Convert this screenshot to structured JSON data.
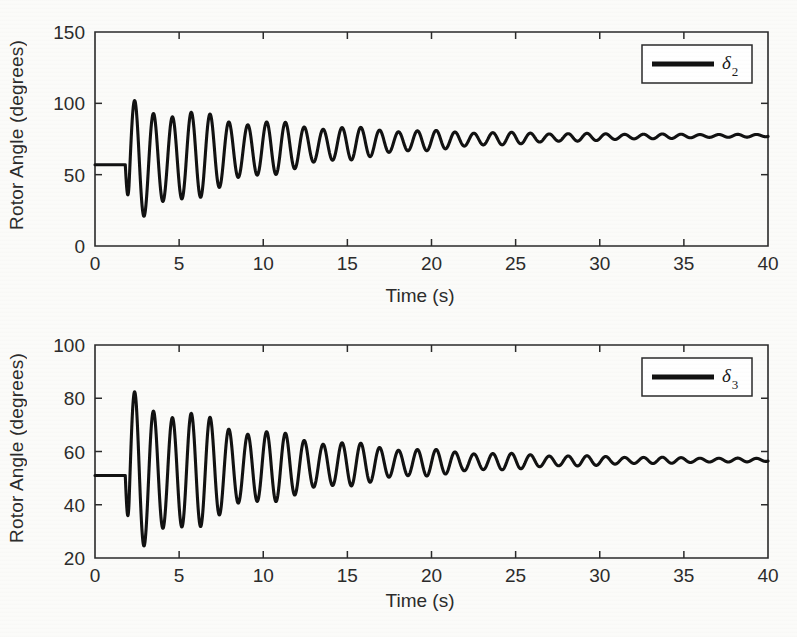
{
  "figure": {
    "background_color": "#fbfbf9",
    "trace_color": "#111111",
    "axis_color": "#2a2a2a"
  },
  "chart_data": [
    {
      "type": "line",
      "panel": "top",
      "title": "",
      "xlabel": "Time (s)",
      "ylabel": "Rotor Angle (degrees)",
      "xlim": [
        0,
        40
      ],
      "ylim": [
        0,
        150
      ],
      "xticks": [
        0,
        5,
        10,
        15,
        20,
        25,
        30,
        35,
        40
      ],
      "yticks": [
        0,
        50,
        100,
        150
      ],
      "xtick_labels": [
        "0",
        "5",
        "10",
        "15",
        "20",
        "25",
        "30",
        "35",
        "40"
      ],
      "ytick_labels": [
        "0",
        "50",
        "100",
        "150"
      ],
      "grid": false,
      "legend_position": "upper right",
      "series": [
        {
          "name": "delta_2",
          "legend_label": "δ",
          "legend_subscript": "2",
          "color": "#111111",
          "initial_value": 57,
          "disturbance_time": 1.8,
          "first_peak_value": 126,
          "first_peak_time": 2.45,
          "first_trough_value": 36,
          "second_peak_value": 97,
          "steady_state_value": 78,
          "oscillation_period": 1.12,
          "damping_time_constant": 9.5,
          "beat_period": 4.6,
          "beat_depth": 0.22,
          "description": "Generator 2 rotor angle: flat pre-fault at 57 deg, step disturbance at t=1.8 s, first swing peak 126 deg, damped oscillations decaying to 78 deg steady state by t=40 s"
        }
      ]
    },
    {
      "type": "line",
      "panel": "bottom",
      "title": "",
      "xlabel": "Time (s)",
      "ylabel": "Rotor Angle (degrees)",
      "xlim": [
        0,
        40
      ],
      "ylim": [
        20,
        100
      ],
      "xticks": [
        0,
        5,
        10,
        15,
        20,
        25,
        30,
        35,
        40
      ],
      "yticks": [
        20,
        40,
        60,
        80,
        100
      ],
      "xtick_labels": [
        "0",
        "5",
        "10",
        "15",
        "20",
        "25",
        "30",
        "35",
        "40"
      ],
      "ytick_labels": [
        "20",
        "40",
        "60",
        "80",
        "100"
      ],
      "grid": false,
      "legend_position": "upper right",
      "series": [
        {
          "name": "delta_3",
          "legend_label": "δ",
          "legend_subscript": "3",
          "color": "#111111",
          "initial_value": 51,
          "disturbance_time": 1.8,
          "first_peak_value": 91,
          "first_peak_time": 2.45,
          "first_trough_value": 29,
          "second_peak_value": 70,
          "steady_state_value": 57,
          "oscillation_period": 1.12,
          "damping_time_constant": 9.5,
          "beat_period": 4.6,
          "beat_depth": 0.22,
          "description": "Generator 3 rotor angle: flat pre-fault at 51 deg, step disturbance at t=1.8 s, first swing peak 91 deg, damped oscillations decaying to 57 deg steady state by t=40 s"
        }
      ]
    }
  ]
}
